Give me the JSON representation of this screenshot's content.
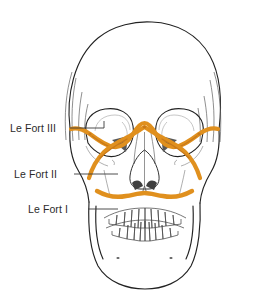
{
  "figure": {
    "background_color": "#ffffff"
  },
  "colors": {
    "fracture_line": "#E0901E",
    "fracture_line_dark": "#C8791A",
    "bone_outline": "#222222",
    "bone_detail": "#8d8d8d",
    "shadow_fill": "#585858",
    "label_text": "#2b2b2b",
    "leader_line": "#3a3a3a"
  },
  "labels": [
    {
      "id": "le-fort-3",
      "text": "Le Fort III",
      "leader_to_x": 104,
      "leader_y": 128
    },
    {
      "id": "le-fort-2",
      "text": "Le Fort II",
      "leader_to_x": 118,
      "leader_y": 174
    },
    {
      "id": "le-fort-1",
      "text": "Le Fort I",
      "leader_to_x": 118,
      "leader_y": 209
    }
  ],
  "fracture_levels": {
    "le_fort_iii": "craniofacial disjunction through zygomatic arch, orbit and nasofrontal suture",
    "le_fort_ii": "pyramidal fracture through nasal bridge, infraorbital rims and maxilla",
    "le_fort_i": "transverse fracture across the maxilla above the teeth"
  }
}
